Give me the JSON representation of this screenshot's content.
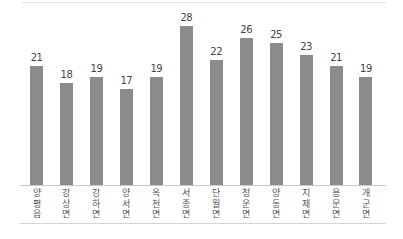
{
  "chart_data": {
    "type": "bar",
    "title": "",
    "xlabel": "",
    "ylabel": "",
    "categories": [
      "양평읍",
      "강상면",
      "강하면",
      "양서면",
      "옥천면",
      "서종면",
      "단월면",
      "청운면",
      "양동면",
      "지제면",
      "용문면",
      "개군면"
    ],
    "values": [
      21,
      18,
      19,
      17,
      19,
      28,
      22,
      26,
      25,
      23,
      21,
      19
    ],
    "ylim": [
      0,
      30
    ],
    "grid": false,
    "legend": "none",
    "data_labels": true,
    "bar_color": "#8b8b8b"
  }
}
